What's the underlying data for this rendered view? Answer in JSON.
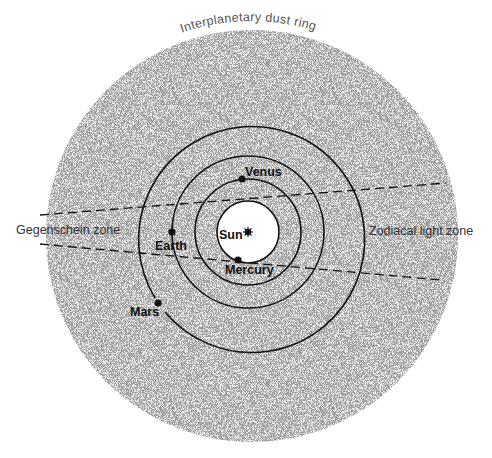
{
  "title": "Interplanetary dust ring",
  "zones": {
    "left": "Gegenschein zone",
    "right": "Zodiacal light zone"
  },
  "center": {
    "name": "Sun",
    "x": 248,
    "y": 232
  },
  "bodies": [
    {
      "name": "Sun",
      "label": "Sun"
    },
    {
      "name": "Mercury",
      "label": "Mercury"
    },
    {
      "name": "Venus",
      "label": "Venus"
    },
    {
      "name": "Earth",
      "label": "Earth"
    },
    {
      "name": "Mars",
      "label": "Mars"
    }
  ],
  "orbits": [
    {
      "name": "Mercury",
      "radius": 31
    },
    {
      "name": "Venus",
      "radius": 53
    },
    {
      "name": "Earth",
      "radius": 76
    },
    {
      "name": "Mars",
      "radius": 113
    }
  ],
  "dust_disk": {
    "cx": 252,
    "cy": 236,
    "radius": 206
  },
  "colors": {
    "line": "#111111",
    "dust": "#9a9a9a",
    "background": "#ffffff"
  }
}
